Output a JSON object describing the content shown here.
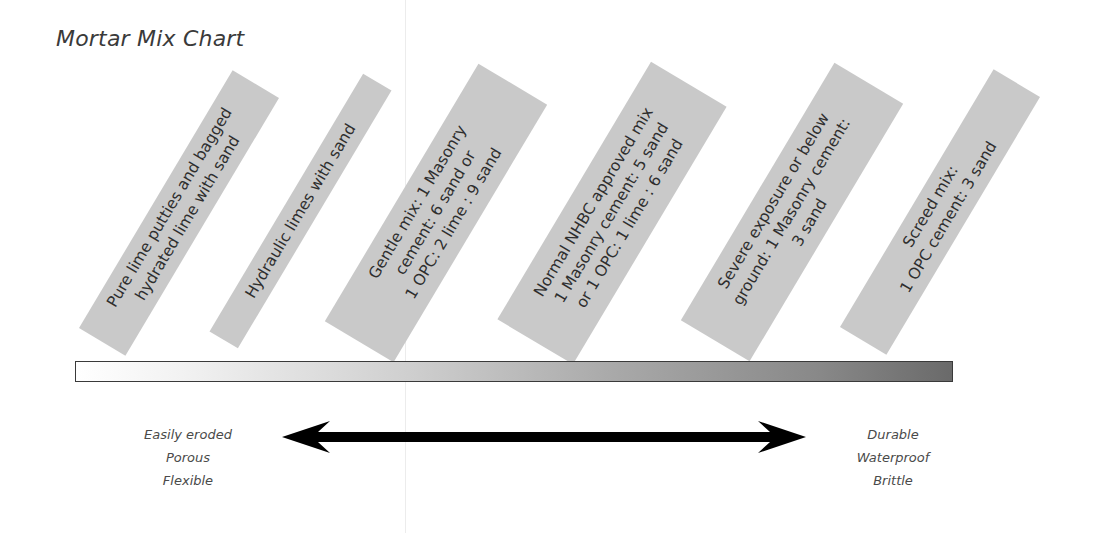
{
  "title": "Mortar Mix Chart",
  "mixes": [
    {
      "label": "Pure lime putties and bagged\nhydrated lime with sand"
    },
    {
      "label": "Hydraulic limes with sand"
    },
    {
      "label": "Gentle mix: 1 Masonry\ncement: 6 sand or\n1 OPC: 2 lime : 9 sand"
    },
    {
      "label": "Normal NHBC approved mix\n1 Masonry cement: 5 sand\nor 1 OPC: 1 lime : 6 sand"
    },
    {
      "label": "Severe exposure or below\nground: 1 Masonry cement:\n3 sand"
    },
    {
      "label": "Screed mix:\n1 OPC cement: 3 sand"
    }
  ],
  "scale": {
    "gradient_start": "#ffffff",
    "gradient_end": "#6a6a6a"
  },
  "left_properties": {
    "line1": "Easily eroded",
    "line2": "Porous",
    "line3": "Flexible"
  },
  "right_properties": {
    "line1": "Durable",
    "line2": "Waterproof",
    "line3": "Brittle"
  },
  "colors": {
    "box_fill": "#c9c9c9",
    "text": "#2e2e2e",
    "arrow": "#000000"
  }
}
